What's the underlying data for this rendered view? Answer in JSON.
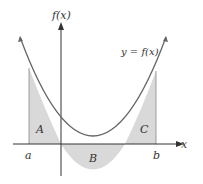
{
  "diagram": {
    "y_axis_label": "f(x)",
    "x_axis_label": "x",
    "curve_label": "y = f(x)",
    "region_labels": [
      "A",
      "B",
      "C"
    ],
    "bound_labels": {
      "a": "a",
      "b": "b"
    },
    "colors": {
      "curve": "#666666",
      "axis": "#333333",
      "fill": "#d9d9d9"
    }
  }
}
